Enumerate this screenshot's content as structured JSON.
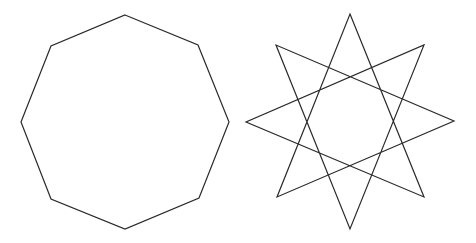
{
  "canvas": {
    "width": 476,
    "height": 243,
    "background": "#ffffff"
  },
  "stroke": {
    "color": "#2a2a2a",
    "width": 1.2
  },
  "shapes": [
    {
      "name": "octagon",
      "type": "regular-polygon",
      "sides": 8,
      "points": "125,15 198,45 229,122 199,198 125,229 51,199 21,122 51,46"
    },
    {
      "name": "octagram",
      "type": "star-polygon",
      "schlafli": "{8/3}",
      "points": "350,14 424,197 246,122 424,45 350,229 276,45 454,121 277,197"
    }
  ]
}
